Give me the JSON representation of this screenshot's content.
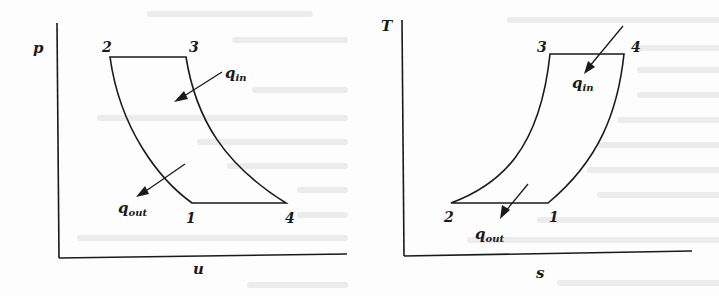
{
  "figure": {
    "colors": {
      "line": "#1a1a1a",
      "background": "#fdfdfd",
      "bleed_through": "#ececec"
    }
  },
  "left_diagram": {
    "y_axis_label": "p",
    "x_axis_label": "u",
    "states": {
      "s1": "1",
      "s2": "2",
      "s3": "3",
      "s4": "4"
    },
    "heat_in": {
      "symbol": "q",
      "subscript": "in"
    },
    "heat_out": {
      "symbol": "q",
      "subscript": "out"
    }
  },
  "right_diagram": {
    "y_axis_label": "T",
    "x_axis_label": "s",
    "states": {
      "s1": "1",
      "s2": "2",
      "s3": "3",
      "s4": "4"
    },
    "heat_in": {
      "symbol": "q",
      "subscript": "in"
    },
    "heat_out": {
      "symbol": "q",
      "subscript": "out"
    }
  }
}
